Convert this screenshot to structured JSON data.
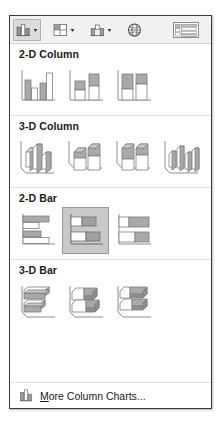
{
  "panel": {
    "name": "Insert Column or Bar Chart gallery"
  },
  "toolbar": {
    "buttons": [
      {
        "icon": "column-chart-icon",
        "caret": "chevron-down-icon",
        "label": "Insert Column or Bar Chart",
        "state": "active"
      },
      {
        "icon": "bar-chart-icon",
        "caret": "chevron-down-icon",
        "label": "Insert Hierarchy Chart",
        "state": "normal"
      },
      {
        "icon": "waterfall-chart-icon",
        "caret": "chevron-down-icon",
        "label": "Insert Waterfall Chart",
        "state": "normal"
      },
      {
        "icon": "globe-map-icon",
        "caret": "",
        "label": "Maps",
        "state": "normal"
      },
      {
        "icon": "pivot-table-icon",
        "caret": "",
        "label": "PivotChart",
        "state": "normal"
      }
    ]
  },
  "sections": [
    {
      "id": "2d-column",
      "title": "2-D Column",
      "items": [
        {
          "id": "clustered-column",
          "label": "Clustered Column",
          "selected": false
        },
        {
          "id": "stacked-column",
          "label": "Stacked Column",
          "selected": false
        },
        {
          "id": "100-stacked-column",
          "label": "100% Stacked Column",
          "selected": false
        }
      ]
    },
    {
      "id": "3d-column",
      "title": "3-D Column",
      "items": [
        {
          "id": "3d-clustered-column",
          "label": "3-D Clustered Column",
          "selected": false
        },
        {
          "id": "3d-stacked-column",
          "label": "3-D Stacked Column",
          "selected": false
        },
        {
          "id": "3d-100-stacked-column",
          "label": "3-D 100% Stacked Column",
          "selected": false
        },
        {
          "id": "3d-column",
          "label": "3-D Column",
          "selected": false
        }
      ]
    },
    {
      "id": "2d-bar",
      "title": "2-D Bar",
      "items": [
        {
          "id": "clustered-bar",
          "label": "Clustered Bar",
          "selected": false
        },
        {
          "id": "stacked-bar",
          "label": "Stacked Bar",
          "selected": true
        },
        {
          "id": "100-stacked-bar",
          "label": "100% Stacked Bar",
          "selected": false
        }
      ]
    },
    {
      "id": "3d-bar",
      "title": "3-D Bar",
      "items": [
        {
          "id": "3d-clustered-bar",
          "label": "3-D Clustered Bar",
          "selected": false
        },
        {
          "id": "3d-stacked-bar",
          "label": "3-D Stacked Bar",
          "selected": false
        },
        {
          "id": "3d-100-stacked-bar",
          "label": "3-D 100% Stacked Bar",
          "selected": false
        }
      ]
    }
  ],
  "footer": {
    "icon": "column-chart-icon",
    "accel": "M",
    "label_rest": "ore Column Charts..."
  },
  "colors": {
    "panel_border": "#3a3a3a",
    "toolbar_bg": "#f1f1f1",
    "separator": "#dedede",
    "selection_bg": "#c9c9c9",
    "selection_border": "#9a9a9a",
    "series_fill": "#a9a9a9",
    "series_outline": "#7d7d7d",
    "axis": "#8c8c8c",
    "text": "#1a1a1a"
  }
}
